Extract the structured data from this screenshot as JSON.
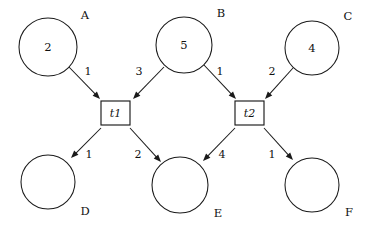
{
  "diagram": {
    "type": "petri-net",
    "title": "",
    "width": 369,
    "height": 227,
    "background_color": "#ffffff",
    "stroke_color": "#1a1a1a",
    "places": [
      {
        "id": "A",
        "label": "A",
        "tokens": "2",
        "cx": 48,
        "cy": 47,
        "r": 29,
        "label_x": 85,
        "label_y": 16
      },
      {
        "id": "B",
        "label": "B",
        "tokens": "5",
        "cx": 184,
        "cy": 45,
        "r": 28,
        "label_x": 221,
        "label_y": 14
      },
      {
        "id": "C",
        "label": "C",
        "tokens": "4",
        "cx": 312,
        "cy": 48,
        "r": 27,
        "label_x": 348,
        "label_y": 17
      },
      {
        "id": "D",
        "label": "D",
        "tokens": "",
        "cx": 48,
        "cy": 182,
        "r": 27,
        "label_x": 85,
        "label_y": 212
      },
      {
        "id": "E",
        "label": "E",
        "tokens": "",
        "cx": 180,
        "cy": 185,
        "r": 28,
        "label_x": 218,
        "label_y": 214
      },
      {
        "id": "F",
        "label": "F",
        "tokens": "",
        "cx": 312,
        "cy": 185,
        "r": 27,
        "label_x": 349,
        "label_y": 213
      }
    ],
    "transitions": [
      {
        "id": "t1",
        "label": "t1",
        "x": 101,
        "y": 101,
        "w": 29,
        "h": 24
      },
      {
        "id": "t2",
        "label": "t2",
        "x": 235,
        "y": 101,
        "w": 29,
        "h": 24
      }
    ],
    "arcs": [
      {
        "id": "A-t1",
        "from": "A",
        "to": "t1",
        "weight": "1",
        "x1": 69,
        "y1": 67,
        "x2": 100,
        "y2": 99,
        "label_x": 88,
        "label_y": 72
      },
      {
        "id": "B-t1",
        "from": "B",
        "to": "t1",
        "weight": "3",
        "x1": 164,
        "y1": 67,
        "x2": 133,
        "y2": 99,
        "label_x": 139,
        "label_y": 72
      },
      {
        "id": "B-t2",
        "from": "B",
        "to": "t2",
        "weight": "1",
        "x1": 204,
        "y1": 65,
        "x2": 236,
        "y2": 99,
        "label_x": 220,
        "label_y": 72
      },
      {
        "id": "C-t2",
        "from": "C",
        "to": "t2",
        "weight": "2",
        "x1": 293,
        "y1": 68,
        "x2": 265,
        "y2": 99,
        "label_x": 272,
        "label_y": 72
      },
      {
        "id": "t1-D",
        "from": "t1",
        "to": "D",
        "weight": "1",
        "x1": 101,
        "y1": 128,
        "x2": 71,
        "y2": 158,
        "label_x": 89,
        "label_y": 155
      },
      {
        "id": "t1-E",
        "from": "t1",
        "to": "E",
        "weight": "2",
        "x1": 130,
        "y1": 128,
        "x2": 161,
        "y2": 162,
        "label_x": 138,
        "label_y": 155
      },
      {
        "id": "t2-E",
        "from": "t2",
        "to": "E",
        "weight": "4",
        "x1": 235,
        "y1": 128,
        "x2": 203,
        "y2": 161,
        "label_x": 222,
        "label_y": 155
      },
      {
        "id": "t2-F",
        "from": "t2",
        "to": "F",
        "weight": "1",
        "x1": 264,
        "y1": 128,
        "x2": 293,
        "y2": 160,
        "label_x": 272,
        "label_y": 155
      }
    ]
  }
}
